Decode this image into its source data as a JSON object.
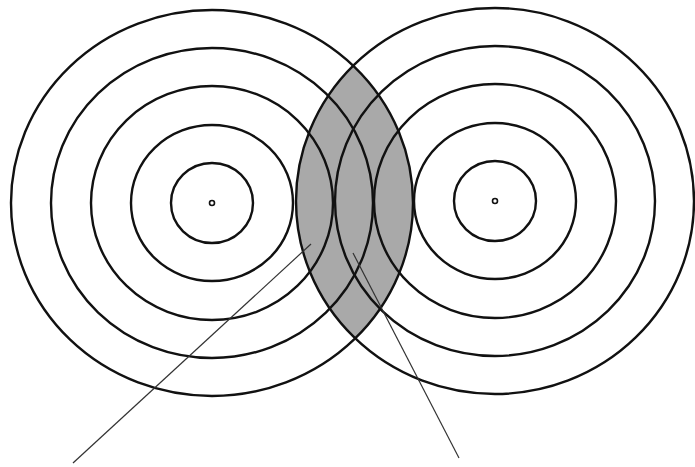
{
  "diagram": {
    "title": "",
    "width": 695,
    "height": 467,
    "colors": {
      "background": "#ffffff",
      "stroke": "#111111",
      "outer_overlap_fill": "#a9a9a9",
      "inner_overlap_fill": "#6f6f6f",
      "pointer": "#333333"
    },
    "sources": [
      {
        "id": "left",
        "cx": 212,
        "cy": 203,
        "center_dot_r": 2.5,
        "rings": [
          {
            "rx": 41,
            "ry": 40
          },
          {
            "rx": 81,
            "ry": 78
          },
          {
            "rx": 121,
            "ry": 117
          },
          {
            "rx": 161,
            "ry": 155
          },
          {
            "rx": 201,
            "ry": 193
          }
        ]
      },
      {
        "id": "right",
        "cx": 495,
        "cy": 201,
        "center_dot_r": 2.5,
        "rings": [
          {
            "rx": 41,
            "ry": 40
          },
          {
            "rx": 81,
            "ry": 78
          },
          {
            "rx": 121,
            "ry": 117
          },
          {
            "rx": 160,
            "ry": 155
          },
          {
            "rx": 199,
            "ry": 193
          }
        ]
      }
    ],
    "overlap_regions": [
      {
        "name": "outer-ring-overlap",
        "ring_index": 4,
        "shade": "light"
      },
      {
        "name": "third-ring-overlap",
        "ring_index": 2,
        "shade": "dark"
      }
    ],
    "pointers": [
      {
        "name": "pointer-light-region",
        "x1": 311,
        "y1": 244,
        "x2": 73,
        "y2": 463
      },
      {
        "name": "pointer-dark-region",
        "x1": 353,
        "y1": 253,
        "x2": 459,
        "y2": 458
      }
    ],
    "labels": []
  }
}
